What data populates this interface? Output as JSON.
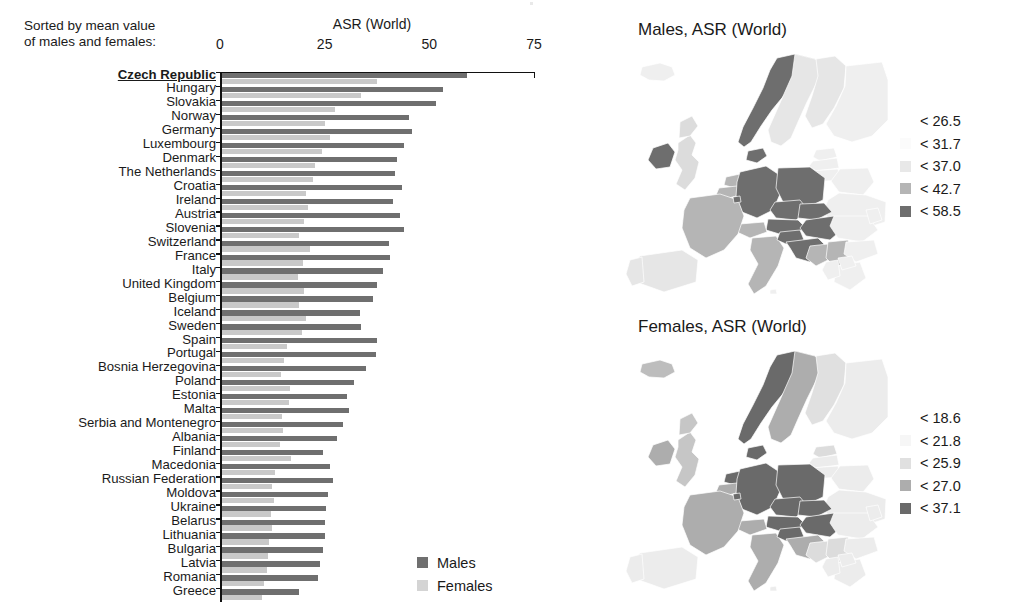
{
  "bar_panel": {
    "sorted_note": "Sorted by mean value\nof males and females:",
    "axis_title": "ASR (World)",
    "legend": {
      "males": "Males",
      "females": "Females"
    }
  },
  "maps": [
    {
      "id": "males",
      "title": "Males, ASR (World)",
      "legend": [
        {
          "label": "< 26.5",
          "color": "#ffffff"
        },
        {
          "label": "< 31.7",
          "color": "#fbfbfb"
        },
        {
          "label": "< 37.0",
          "color": "#e8e8e8"
        },
        {
          "label": "< 42.7",
          "color": "#b5b5b5"
        },
        {
          "label": "< 58.5",
          "color": "#6e6e6e"
        }
      ]
    },
    {
      "id": "females",
      "title": "Females, ASR (World)",
      "legend": [
        {
          "label": "< 18.6",
          "color": "#ffffff"
        },
        {
          "label": "< 21.8",
          "color": "#f6f6f6"
        },
        {
          "label": "< 25.9",
          "color": "#e0e0e0"
        },
        {
          "label": "< 27.0",
          "color": "#adadad"
        },
        {
          "label": "< 37.1",
          "color": "#6a6a6a"
        }
      ]
    }
  ],
  "chart_data": {
    "type": "bar",
    "orientation": "horizontal",
    "title": "ASR (World)",
    "xlabel": "ASR (World)",
    "ylabel": "",
    "xlim": [
      0,
      75
    ],
    "xticks": [
      0,
      25,
      50,
      75
    ],
    "grid": false,
    "legend_position": "bottom-right",
    "note": "Sorted by mean value of males and females",
    "highlight": "Czech Republic",
    "categories": [
      "Czech Republic",
      "Hungary",
      "Slovakia",
      "Norway",
      "Germany",
      "Luxembourg",
      "Denmark",
      "The Netherlands",
      "Croatia",
      "Ireland",
      "Austria",
      "Slovenia",
      "Switzerland",
      "France",
      "Italy",
      "United Kingdom",
      "Belgium",
      "Iceland",
      "Sweden",
      "Spain",
      "Portugal",
      "Bosnia Herzegovina",
      "Poland",
      "Estonia",
      "Malta",
      "Serbia and Montenegro",
      "Albania",
      "Finland",
      "Macedonia",
      "Russian Federation",
      "Moldova",
      "Ukraine",
      "Belarus",
      "Lithuania",
      "Bulgaria",
      "Latvia",
      "Romania",
      "Greece"
    ],
    "series": [
      {
        "name": "Males",
        "color": "#6f6f6f",
        "values": [
          58.5,
          53.0,
          51.2,
          44.8,
          45.5,
          43.6,
          41.9,
          41.4,
          43.1,
          41.0,
          42.7,
          43.5,
          40.0,
          40.3,
          38.6,
          37.0,
          36.2,
          33.0,
          33.2,
          37.2,
          36.8,
          34.5,
          31.7,
          30.0,
          30.4,
          29.1,
          27.5,
          24.2,
          25.8,
          26.5,
          25.3,
          25.0,
          24.6,
          24.8,
          24.3,
          23.6,
          23.0,
          18.4
        ]
      },
      {
        "name": "Females",
        "color": "#c9c9c9",
        "values": [
          37.1,
          33.2,
          27.0,
          24.6,
          25.9,
          23.9,
          22.3,
          21.8,
          20.2,
          20.6,
          19.8,
          18.6,
          21.0,
          19.4,
          18.2,
          19.6,
          18.4,
          20.1,
          19.2,
          15.6,
          14.8,
          14.2,
          16.3,
          16.0,
          14.4,
          14.6,
          13.9,
          16.6,
          12.8,
          12.0,
          12.6,
          11.8,
          12.0,
          11.4,
          11.1,
          10.9,
          10.2,
          9.6
        ]
      }
    ]
  }
}
